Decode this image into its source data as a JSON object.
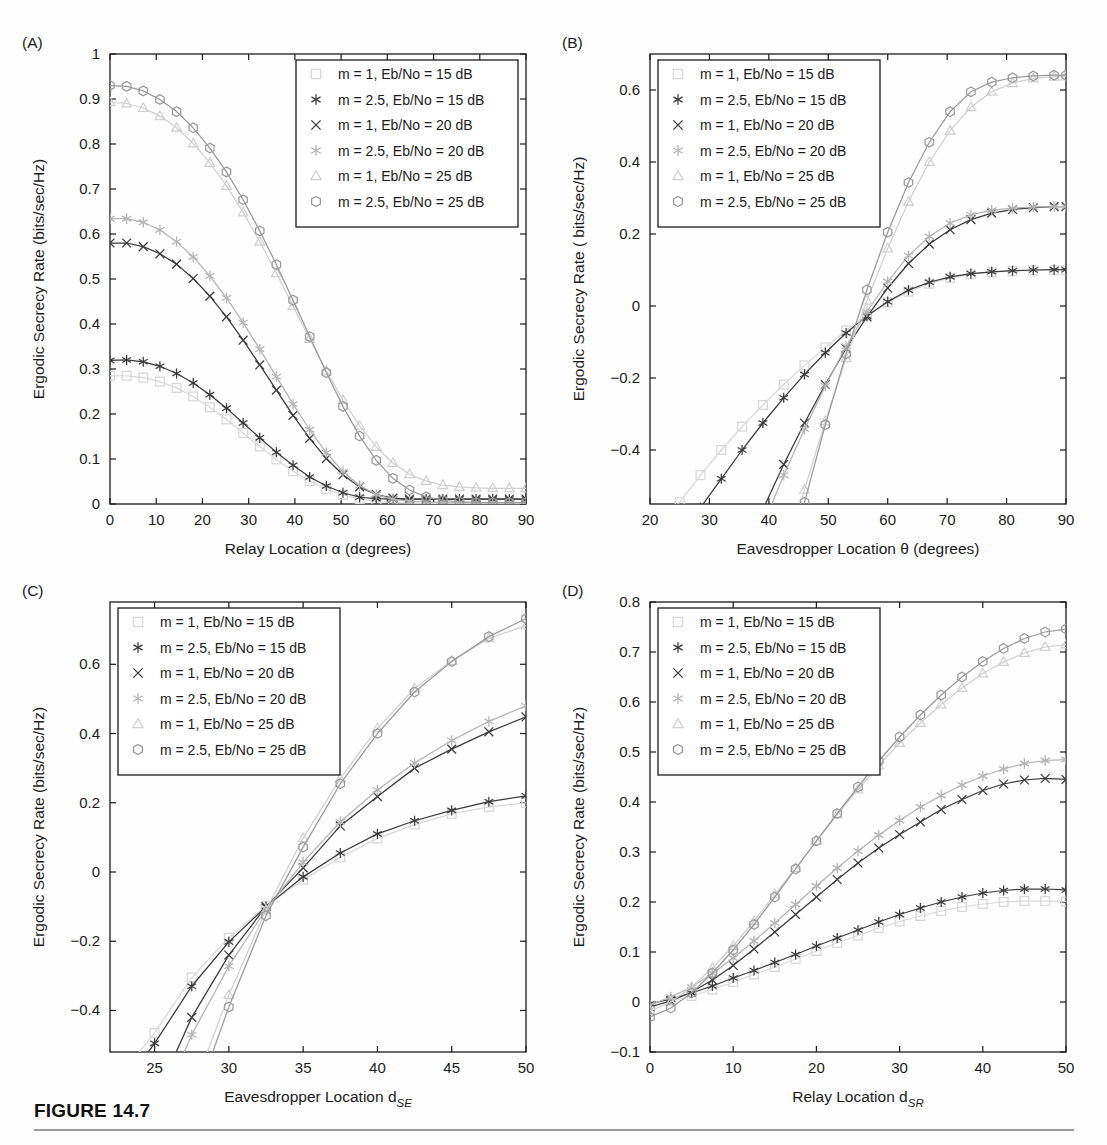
{
  "figure": {
    "caption": "FIGURE 14.7",
    "panel_letters": [
      "(A)",
      "(B)",
      "(C)",
      "(D)"
    ]
  },
  "legend": {
    "entries": [
      {
        "label": "m = 1, Eb/No = 15 dB",
        "marker": "square",
        "color": "#d8d8d8"
      },
      {
        "label": "m = 2.5, Eb/No = 15 dB",
        "marker": "asterisk",
        "color": "#3a3a3a"
      },
      {
        "label": "m = 1, Eb/No = 20 dB",
        "marker": "cross",
        "color": "#3a3a3a"
      },
      {
        "label": "m = 2.5, Eb/No = 20 dB",
        "marker": "hexagram",
        "color": "#b4b4b4"
      },
      {
        "label": "m = 1, Eb/No = 25 dB",
        "marker": "triangle",
        "color": "#d0d0d0"
      },
      {
        "label": "m = 2.5, Eb/No = 25 dB",
        "marker": "hexagon",
        "color": "#9a9a9a"
      }
    ]
  },
  "chart_data": [
    {
      "panel": "(A)",
      "type": "line",
      "title": "",
      "xlabel": "Relay Location α (degrees)",
      "ylabel": "Ergodic Secrecy Rate (bits/sec/Hz)",
      "xlim": [
        0,
        90
      ],
      "ylim": [
        0,
        1
      ],
      "xticks": [
        0,
        10,
        20,
        30,
        40,
        50,
        60,
        70,
        80,
        90
      ],
      "yticks": [
        0,
        0.1,
        0.2,
        0.3,
        0.4,
        0.5,
        0.6,
        0.7,
        0.8,
        0.9,
        1
      ],
      "grid": false,
      "legend_position": "top-right",
      "x": [
        0,
        3.6,
        7.2,
        10.8,
        14.4,
        18,
        21.6,
        25.2,
        28.8,
        32.4,
        36,
        39.6,
        43.2,
        46.8,
        50.4,
        54,
        57.6,
        61.2,
        64.8,
        68.4,
        72,
        75.6,
        79.2,
        82.8,
        86.4,
        90
      ],
      "series": [
        {
          "name": "m = 1, Eb/No = 15 dB",
          "values": [
            0.285,
            0.285,
            0.281,
            0.272,
            0.258,
            0.239,
            0.215,
            0.188,
            0.158,
            0.128,
            0.099,
            0.073,
            0.051,
            0.033,
            0.02,
            0.011,
            0.006,
            0.003,
            0.002,
            0.001,
            0.001,
            0.001,
            0.001,
            0.001,
            0.001,
            0.001
          ]
        },
        {
          "name": "m = 2.5, Eb/No = 15 dB",
          "values": [
            0.319,
            0.32,
            0.316,
            0.306,
            0.29,
            0.269,
            0.243,
            0.213,
            0.18,
            0.147,
            0.115,
            0.086,
            0.06,
            0.04,
            0.025,
            0.015,
            0.012,
            0.011,
            0.011,
            0.011,
            0.011,
            0.011,
            0.011,
            0.011,
            0.011,
            0.011
          ]
        },
        {
          "name": "m = 1, Eb/No = 20 dB",
          "values": [
            0.58,
            0.58,
            0.572,
            0.556,
            0.533,
            0.501,
            0.462,
            0.416,
            0.364,
            0.309,
            0.253,
            0.197,
            0.146,
            0.101,
            0.065,
            0.038,
            0.021,
            0.013,
            0.011,
            0.011,
            0.011,
            0.011,
            0.011,
            0.011,
            0.011,
            0.011
          ]
        },
        {
          "name": "m = 2.5, Eb/No = 20 dB",
          "values": [
            0.634,
            0.634,
            0.626,
            0.609,
            0.583,
            0.549,
            0.507,
            0.458,
            0.403,
            0.344,
            0.283,
            0.222,
            0.165,
            0.114,
            0.072,
            0.041,
            0.021,
            0.011,
            0.006,
            0.004,
            0.003,
            0.003,
            0.003,
            0.003,
            0.003,
            0.003
          ]
        },
        {
          "name": "m = 1, Eb/No = 25 dB",
          "values": [
            0.893,
            0.89,
            0.88,
            0.862,
            0.836,
            0.801,
            0.758,
            0.707,
            0.648,
            0.583,
            0.513,
            0.44,
            0.367,
            0.296,
            0.231,
            0.174,
            0.127,
            0.091,
            0.066,
            0.051,
            0.042,
            0.038,
            0.036,
            0.035,
            0.035,
            0.035
          ]
        },
        {
          "name": "m = 2.5, Eb/No = 25 dB",
          "values": [
            0.93,
            0.928,
            0.918,
            0.899,
            0.872,
            0.836,
            0.791,
            0.738,
            0.676,
            0.607,
            0.532,
            0.453,
            0.372,
            0.292,
            0.217,
            0.151,
            0.097,
            0.057,
            0.031,
            0.016,
            0.008,
            0.005,
            0.003,
            0.003,
            0.003,
            0.003
          ]
        }
      ]
    },
    {
      "panel": "(B)",
      "type": "line",
      "title": "",
      "xlabel": "Eavesdropper Location θ (degrees)",
      "ylabel": "Ergodic Secrecy Rate ( bits/sec/Hz)",
      "xlim": [
        20,
        90
      ],
      "ylim": [
        -0.55,
        0.7
      ],
      "xticks": [
        20,
        30,
        40,
        50,
        60,
        70,
        80,
        90
      ],
      "yticks": [
        -0.4,
        -0.2,
        0,
        0.2,
        0.4,
        0.6
      ],
      "grid": false,
      "legend_position": "top-left",
      "x": [
        21.5,
        25,
        28.5,
        32,
        35.5,
        39,
        42.5,
        46,
        49.5,
        53,
        56.5,
        60,
        63.5,
        67,
        70.5,
        74,
        77.5,
        81,
        84.5,
        88,
        90
      ],
      "series": [
        {
          "name": "m = 1, Eb/No = 15 dB",
          "values": [
            -0.6,
            -0.545,
            -0.47,
            -0.4,
            -0.335,
            -0.275,
            -0.218,
            -0.165,
            -0.115,
            -0.068,
            -0.026,
            0.01,
            0.04,
            0.062,
            0.078,
            0.088,
            0.094,
            0.097,
            0.099,
            0.1,
            0.1
          ]
        },
        {
          "name": "m = 2.5, Eb/No = 15 dB",
          "values": [
            -0.72,
            -0.645,
            -0.56,
            -0.48,
            -0.4,
            -0.325,
            -0.255,
            -0.19,
            -0.13,
            -0.075,
            -0.028,
            0.012,
            0.044,
            0.066,
            0.081,
            0.09,
            0.095,
            0.098,
            0.1,
            0.101,
            0.101
          ]
        },
        {
          "name": "m = 1, Eb/No = 20 dB",
          "values": [
            -1.35,
            -1.18,
            -1.0,
            -0.845,
            -0.7,
            -0.565,
            -0.44,
            -0.325,
            -0.218,
            -0.118,
            -0.03,
            0.05,
            0.118,
            0.172,
            0.212,
            0.24,
            0.258,
            0.268,
            0.273,
            0.276,
            0.276
          ]
        },
        {
          "name": "m = 2.5, Eb/No = 20 dB",
          "values": [
            -1.5,
            -1.3,
            -1.1,
            -0.925,
            -0.76,
            -0.61,
            -0.47,
            -0.342,
            -0.222,
            -0.112,
            -0.016,
            0.068,
            0.14,
            0.193,
            0.23,
            0.253,
            0.266,
            0.272,
            0.275,
            0.276,
            0.276
          ]
        },
        {
          "name": "m = 1, Eb/No = 25 dB",
          "values": [
            -2.3,
            -2.0,
            -1.7,
            -1.43,
            -1.17,
            -0.935,
            -0.715,
            -0.51,
            -0.32,
            -0.145,
            0.015,
            0.16,
            0.29,
            0.4,
            0.487,
            0.552,
            0.595,
            0.619,
            0.632,
            0.637,
            0.638
          ]
        },
        {
          "name": "m = 2.5, Eb/No = 25 dB",
          "values": [
            -2.55,
            -2.22,
            -1.9,
            -1.59,
            -1.3,
            -1.03,
            -0.78,
            -0.545,
            -0.33,
            -0.133,
            0.045,
            0.205,
            0.343,
            0.455,
            0.54,
            0.595,
            0.622,
            0.634,
            0.639,
            0.641,
            0.641
          ]
        }
      ]
    },
    {
      "panel": "(C)",
      "type": "line",
      "title": "",
      "xlabel": "Eavesdropper Location d_SE",
      "xlabel_main": "Eavesdropper Location d",
      "xlabel_sub": "SE",
      "ylabel": "Ergodic Secrecy Rate (bits/sec/Hz)",
      "xlim": [
        22,
        50
      ],
      "ylim": [
        -0.52,
        0.78
      ],
      "xticks": [
        25,
        30,
        35,
        40,
        45,
        50
      ],
      "yticks": [
        -0.4,
        -0.2,
        0,
        0.2,
        0.4,
        0.6
      ],
      "grid": false,
      "legend_position": "top-left",
      "x": [
        22.5,
        25,
        27.5,
        30,
        32.5,
        35,
        37.5,
        40,
        42.5,
        45,
        47.5,
        50
      ],
      "series": [
        {
          "name": "m = 1, Eb/No = 15 dB",
          "values": [
            -0.6,
            -0.465,
            -0.305,
            -0.19,
            -0.098,
            -0.022,
            0.042,
            0.097,
            0.137,
            0.168,
            0.188,
            0.2
          ]
        },
        {
          "name": "m = 2.5, Eb/No = 15 dB",
          "values": [
            -0.64,
            -0.495,
            -0.33,
            -0.202,
            -0.1,
            -0.014,
            0.055,
            0.11,
            0.148,
            0.178,
            0.203,
            0.22
          ]
        },
        {
          "name": "m = 1, Eb/No = 20 dB",
          "values": [
            -0.88,
            -0.66,
            -0.42,
            -0.24,
            -0.1,
            0.012,
            0.133,
            0.218,
            0.3,
            0.355,
            0.405,
            0.448
          ]
        },
        {
          "name": "m = 2.5, Eb/No = 20 dB",
          "values": [
            -0.96,
            -0.72,
            -0.47,
            -0.272,
            -0.108,
            0.028,
            0.145,
            0.237,
            0.315,
            0.38,
            0.435,
            0.48
          ]
        },
        {
          "name": "m = 1, Eb/No = 25 dB",
          "values": [
            -1.3,
            -0.99,
            -0.64,
            -0.355,
            -0.11,
            0.098,
            0.27,
            0.415,
            0.53,
            0.61,
            0.675,
            0.712
          ]
        },
        {
          "name": "m = 2.5, Eb/No = 25 dB",
          "values": [
            -1.42,
            -1.05,
            -0.69,
            -0.39,
            -0.126,
            0.072,
            0.255,
            0.4,
            0.52,
            0.608,
            0.68,
            0.732
          ]
        }
      ]
    },
    {
      "panel": "(D)",
      "type": "line",
      "title": "",
      "xlabel": "Relay Location d_SR",
      "xlabel_main": "Relay Location d",
      "xlabel_sub": "SR",
      "ylabel": "Ergodic Secrecy Rate (bits/sec/Hz)",
      "xlim": [
        0,
        50
      ],
      "ylim": [
        -0.1,
        0.8
      ],
      "xticks": [
        0,
        10,
        20,
        30,
        40,
        50
      ],
      "yticks": [
        -0.1,
        0,
        0.1,
        0.2,
        0.3,
        0.4,
        0.5,
        0.6,
        0.7,
        0.8
      ],
      "grid": false,
      "legend_position": "top-left",
      "x": [
        0,
        2.5,
        5,
        7.5,
        10,
        12.5,
        15,
        17.5,
        20,
        22.5,
        25,
        27.5,
        30,
        32.5,
        35,
        37.5,
        40,
        42.5,
        45,
        47.5,
        50
      ],
      "series": [
        {
          "name": "m = 1, Eb/No = 15 dB",
          "values": [
            -0.008,
            0.002,
            0.012,
            0.025,
            0.04,
            0.055,
            0.07,
            0.086,
            0.102,
            0.118,
            0.133,
            0.148,
            0.161,
            0.172,
            0.182,
            0.19,
            0.196,
            0.2,
            0.202,
            0.202,
            0.201
          ]
        },
        {
          "name": "m = 2.5, Eb/No = 15 dB",
          "values": [
            -0.004,
            0.006,
            0.018,
            0.032,
            0.048,
            0.063,
            0.079,
            0.095,
            0.112,
            0.128,
            0.144,
            0.16,
            0.175,
            0.188,
            0.2,
            0.21,
            0.218,
            0.223,
            0.226,
            0.226,
            0.224
          ]
        },
        {
          "name": "m = 1, Eb/No = 20 dB",
          "values": [
            -0.01,
            0.002,
            0.02,
            0.044,
            0.073,
            0.106,
            0.14,
            0.175,
            0.21,
            0.245,
            0.278,
            0.308,
            0.335,
            0.36,
            0.385,
            0.405,
            0.423,
            0.436,
            0.444,
            0.447,
            0.445
          ]
        },
        {
          "name": "m = 2.5, Eb/No = 20 dB",
          "values": [
            -0.006,
            0.01,
            0.03,
            0.057,
            0.088,
            0.122,
            0.158,
            0.195,
            0.232,
            0.268,
            0.302,
            0.334,
            0.363,
            0.39,
            0.413,
            0.434,
            0.452,
            0.466,
            0.477,
            0.483,
            0.485
          ]
        },
        {
          "name": "m = 1, Eb/No = 25 dB",
          "values": [
            -0.018,
            0.0,
            0.03,
            0.068,
            0.112,
            0.162,
            0.215,
            0.268,
            0.322,
            0.375,
            0.425,
            0.473,
            0.518,
            0.558,
            0.595,
            0.628,
            0.657,
            0.68,
            0.698,
            0.71,
            0.715
          ]
        },
        {
          "name": "m = 2.5, Eb/No = 25 dB",
          "values": [
            -0.03,
            -0.012,
            0.018,
            0.058,
            0.104,
            0.155,
            0.21,
            0.266,
            0.322,
            0.377,
            0.43,
            0.482,
            0.53,
            0.574,
            0.614,
            0.65,
            0.681,
            0.707,
            0.727,
            0.74,
            0.746
          ]
        }
      ]
    }
  ]
}
